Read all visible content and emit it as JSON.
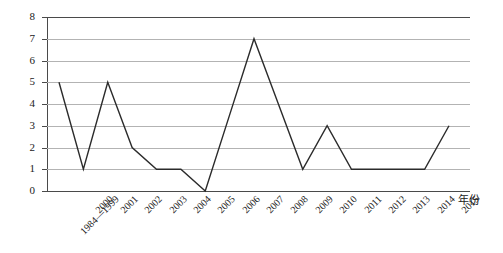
{
  "chart_data": {
    "type": "line",
    "title": "",
    "xlabel": "年份",
    "ylabel": "",
    "grid": true,
    "legend": "none",
    "ylim": [
      0,
      8
    ],
    "ytick_labels": [
      "8",
      "7",
      "6",
      "5",
      "4",
      "3",
      "2",
      "1",
      "0"
    ],
    "ytick_values": [
      8,
      7,
      6,
      5,
      4,
      3,
      2,
      1,
      0
    ],
    "categories": [
      "1984—1999",
      "2000",
      "2001",
      "2002",
      "2003",
      "2004",
      "2005",
      "2006",
      "2007",
      "2008",
      "2009",
      "2010",
      "2011",
      "2012",
      "2013",
      "2014",
      "2015"
    ],
    "values": [
      5,
      1,
      5,
      2,
      1,
      1,
      0,
      3.5,
      7,
      4,
      1,
      3,
      1,
      1,
      1,
      1,
      3
    ],
    "series": [
      {
        "name": "",
        "values": [
          5,
          1,
          5,
          2,
          1,
          1,
          0,
          3.5,
          7,
          4,
          1,
          3,
          1,
          1,
          1,
          1,
          3
        ]
      }
    ]
  },
  "style": {
    "line_color": "#2b2b2b",
    "grid_color": "#b3b3b3",
    "axis_color": "#4a4a4a",
    "background": "#ffffff",
    "text_color": "#1a1a1a"
  }
}
